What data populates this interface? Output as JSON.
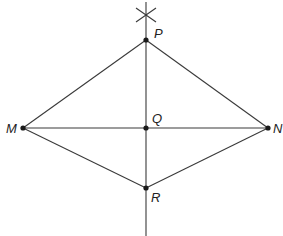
{
  "diagram": {
    "type": "geometric-construction",
    "points": [
      {
        "id": "P",
        "label": "P",
        "x": 146,
        "y": 40
      },
      {
        "id": "M",
        "label": "M",
        "x": 23,
        "y": 128
      },
      {
        "id": "N",
        "label": "N",
        "x": 268,
        "y": 128
      },
      {
        "id": "Q",
        "label": "Q",
        "x": 146,
        "y": 128
      },
      {
        "id": "R",
        "label": "R",
        "x": 146,
        "y": 188
      }
    ],
    "segments": [
      {
        "from": "M",
        "to": "P"
      },
      {
        "from": "P",
        "to": "N"
      },
      {
        "from": "M",
        "to": "R"
      },
      {
        "from": "R",
        "to": "N"
      },
      {
        "from": "M",
        "to": "N"
      }
    ],
    "perpendicular_line": {
      "x": 146,
      "y_start": 2,
      "y_end": 236
    },
    "arc_intersection_mark": {
      "x": 146,
      "y": 15
    }
  },
  "labels": {
    "P": "P",
    "M": "M",
    "N": "N",
    "Q": "Q",
    "R": "R"
  }
}
